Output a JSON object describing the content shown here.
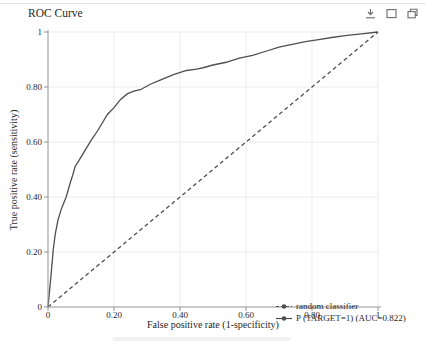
{
  "window": {
    "title": "ROC Curve",
    "toolbar": {
      "icons": [
        {
          "name": "download"
        },
        {
          "name": "maximize"
        },
        {
          "name": "open-in-new-window"
        }
      ]
    }
  },
  "chart_data": {
    "type": "line",
    "title": "ROC Curve",
    "xlabel": "False positive rate (1-specificity)",
    "ylabel": "True positive rate (sensitivity)",
    "xlim": [
      0,
      1
    ],
    "ylim": [
      0,
      1
    ],
    "grid": true,
    "x_ticks": {
      "values": [
        0,
        0.2,
        0.4,
        0.6,
        0.8,
        1
      ],
      "labels": [
        "0",
        "0.20",
        "0.40",
        "0.60",
        "0.80",
        "1"
      ]
    },
    "y_ticks": {
      "values": [
        0,
        0.2,
        0.4,
        0.6,
        0.8,
        1
      ],
      "labels": [
        "0",
        "0.20",
        "0.40",
        "0.60",
        "0.80",
        "1"
      ]
    },
    "legend_position": "inside-bottom-right",
    "colors": {
      "axis": "#939393",
      "grid": "#ececec",
      "line": "#4f4f4f"
    },
    "series": [
      {
        "name": "random classifier",
        "line_style": "dashed",
        "color": "#4f4f4f",
        "points": [
          [
            0,
            0
          ],
          [
            1,
            1
          ]
        ]
      },
      {
        "name": "P (TARGET=1) (AUC=0.822)",
        "auc": 0.822,
        "line_style": "solid",
        "color": "#4f4f4f",
        "points": [
          [
            0,
            0
          ],
          [
            0.004,
            0.05
          ],
          [
            0.008,
            0.1
          ],
          [
            0.012,
            0.155
          ],
          [
            0.016,
            0.21
          ],
          [
            0.022,
            0.265
          ],
          [
            0.03,
            0.315
          ],
          [
            0.04,
            0.355
          ],
          [
            0.055,
            0.4
          ],
          [
            0.067,
            0.45
          ],
          [
            0.075,
            0.48
          ],
          [
            0.082,
            0.51
          ],
          [
            0.1,
            0.545
          ],
          [
            0.115,
            0.575
          ],
          [
            0.13,
            0.605
          ],
          [
            0.15,
            0.64
          ],
          [
            0.16,
            0.66
          ],
          [
            0.18,
            0.7
          ],
          [
            0.2,
            0.725
          ],
          [
            0.22,
            0.755
          ],
          [
            0.24,
            0.775
          ],
          [
            0.26,
            0.785
          ],
          [
            0.28,
            0.79
          ],
          [
            0.31,
            0.81
          ],
          [
            0.34,
            0.825
          ],
          [
            0.38,
            0.845
          ],
          [
            0.42,
            0.86
          ],
          [
            0.45,
            0.865
          ],
          [
            0.47,
            0.87
          ],
          [
            0.5,
            0.88
          ],
          [
            0.54,
            0.89
          ],
          [
            0.58,
            0.905
          ],
          [
            0.62,
            0.915
          ],
          [
            0.66,
            0.93
          ],
          [
            0.7,
            0.945
          ],
          [
            0.74,
            0.955
          ],
          [
            0.78,
            0.965
          ],
          [
            0.82,
            0.972
          ],
          [
            0.86,
            0.98
          ],
          [
            0.9,
            0.987
          ],
          [
            0.95,
            0.993
          ],
          [
            1,
            1
          ]
        ]
      }
    ]
  }
}
